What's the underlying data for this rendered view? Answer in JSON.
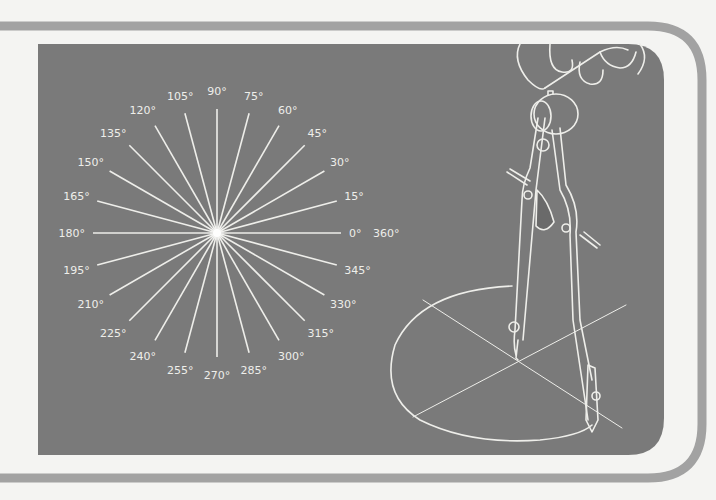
{
  "figure": {
    "type": "illustration",
    "colors": {
      "page_background": "#f4f4f2",
      "border_stripe": "#a2a2a2",
      "panel": "#7a7a7a",
      "line": "#eeeeea"
    }
  },
  "angle_diagram": {
    "center": [
      217,
      233
    ],
    "radius": 124,
    "step_degrees": 15,
    "labels": [
      {
        "angle": 0,
        "text": "0°"
      },
      {
        "angle": 360,
        "text": "360°"
      },
      {
        "angle": 15,
        "text": "15°"
      },
      {
        "angle": 30,
        "text": "30°"
      },
      {
        "angle": 45,
        "text": "45°"
      },
      {
        "angle": 60,
        "text": "60°"
      },
      {
        "angle": 75,
        "text": "75°"
      },
      {
        "angle": 90,
        "text": "90°"
      },
      {
        "angle": 105,
        "text": "105°"
      },
      {
        "angle": 120,
        "text": "120°"
      },
      {
        "angle": 135,
        "text": "135°"
      },
      {
        "angle": 150,
        "text": "150°"
      },
      {
        "angle": 165,
        "text": "165°"
      },
      {
        "angle": 180,
        "text": "180°"
      },
      {
        "angle": 195,
        "text": "195°"
      },
      {
        "angle": 210,
        "text": "210°"
      },
      {
        "angle": 225,
        "text": "225°"
      },
      {
        "angle": 240,
        "text": "240°"
      },
      {
        "angle": 255,
        "text": "255°"
      },
      {
        "angle": 270,
        "text": "270°"
      },
      {
        "angle": 285,
        "text": "285°"
      },
      {
        "angle": 300,
        "text": "300°"
      },
      {
        "angle": 315,
        "text": "315°"
      },
      {
        "angle": 330,
        "text": "330°"
      },
      {
        "angle": 345,
        "text": "345°"
      }
    ]
  },
  "compass_illustration": {
    "description": "Hand holding a drafting compass drawing a circle with crosshair guide lines"
  }
}
